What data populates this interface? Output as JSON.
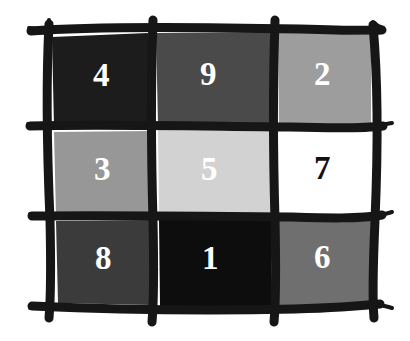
{
  "figure": {
    "name": "magic-square",
    "type": "grid",
    "rows": 3,
    "columns": 3,
    "background_color": "#ffffff",
    "stroke_color": "#161616",
    "style": "hand-drawn"
  },
  "cells": [
    {
      "value": "4",
      "row": 0,
      "col": 0,
      "fill": "#1c1c1c",
      "text_color": "#ffffff"
    },
    {
      "value": "9",
      "row": 0,
      "col": 1,
      "fill": "#4a4a4a",
      "text_color": "#ffffff"
    },
    {
      "value": "2",
      "row": 0,
      "col": 2,
      "fill": "#9d9d9d",
      "text_color": "#ffffff"
    },
    {
      "value": "3",
      "row": 1,
      "col": 0,
      "fill": "#979797",
      "text_color": "#ffffff"
    },
    {
      "value": "5",
      "row": 1,
      "col": 1,
      "fill": "#d2d2d2",
      "text_color": "#ffffff"
    },
    {
      "value": "7",
      "row": 1,
      "col": 2,
      "fill": "#ffffff",
      "text_color": "#111111"
    },
    {
      "value": "8",
      "row": 2,
      "col": 0,
      "fill": "#3b3b3b",
      "text_color": "#ffffff"
    },
    {
      "value": "1",
      "row": 2,
      "col": 1,
      "fill": "#0d0d0d",
      "text_color": "#ffffff"
    },
    {
      "value": "6",
      "row": 2,
      "col": 2,
      "fill": "#6f6f6f",
      "text_color": "#ffffff"
    }
  ]
}
